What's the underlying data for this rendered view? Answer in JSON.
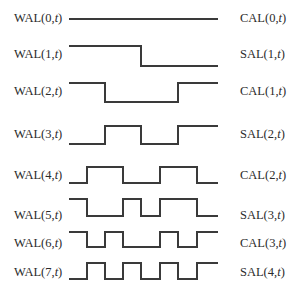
{
  "diagram": {
    "type": "walsh-function-waveforms",
    "x_start": 69,
    "x_end": 218,
    "grid_x": [
      69,
      87,
      105,
      123,
      141,
      160,
      178,
      197,
      218
    ],
    "rows": [
      {
        "left_label": "WAL(0,",
        "left_var": "t",
        "right_label": "CAL(0,",
        "right_var": "t",
        "label_y": 11,
        "high_y": 19,
        "low_y": 19,
        "levels": [
          1,
          1,
          1,
          1,
          1,
          1,
          1,
          1
        ]
      },
      {
        "left_label": "WAL(1,",
        "left_var": "t",
        "right_label": "SAL(1,",
        "right_var": "t",
        "label_y": 47,
        "high_y": 46,
        "low_y": 66,
        "levels": [
          1,
          1,
          1,
          1,
          0,
          0,
          0,
          0
        ]
      },
      {
        "left_label": "WAL(2,",
        "left_var": "t",
        "right_label": "CAL(1,",
        "right_var": "t",
        "label_y": 84,
        "high_y": 83,
        "low_y": 102,
        "levels": [
          1,
          1,
          0,
          0,
          0,
          0,
          1,
          1
        ]
      },
      {
        "left_label": "WAL(3,",
        "left_var": "t",
        "right_label": "SAL(2,",
        "right_var": "t",
        "label_y": 127,
        "high_y": 126,
        "low_y": 144,
        "levels": [
          0,
          0,
          1,
          1,
          0,
          0,
          1,
          1
        ]
      },
      {
        "left_label": "WAL(4,",
        "left_var": "t",
        "right_label": "CAL(2,",
        "right_var": "t",
        "label_y": 168,
        "high_y": 167,
        "low_y": 183,
        "levels": [
          0,
          1,
          1,
          0,
          0,
          1,
          1,
          0
        ]
      },
      {
        "left_label": "WAL(5,",
        "left_var": "t",
        "right_label": "SAL(3,",
        "right_var": "t",
        "label_y": 208,
        "high_y": 199,
        "low_y": 216,
        "levels": [
          1,
          0,
          0,
          1,
          0,
          1,
          1,
          0
        ]
      },
      {
        "left_label": "WAL(6,",
        "left_var": "t",
        "right_label": "CAL(3,",
        "right_var": "t",
        "label_y": 236,
        "high_y": 232,
        "low_y": 247,
        "levels": [
          1,
          0,
          1,
          0,
          0,
          1,
          0,
          1
        ]
      },
      {
        "left_label": "WAL(7,",
        "left_var": "t",
        "right_label": "SAL(4,",
        "right_var": "t",
        "label_y": 265,
        "high_y": 263,
        "low_y": 279,
        "levels": [
          0,
          1,
          0,
          1,
          0,
          1,
          0,
          1
        ]
      }
    ],
    "colors": {
      "line": "#3a3a3a",
      "text": "#2b2b2b",
      "background": "#ffffff"
    }
  }
}
